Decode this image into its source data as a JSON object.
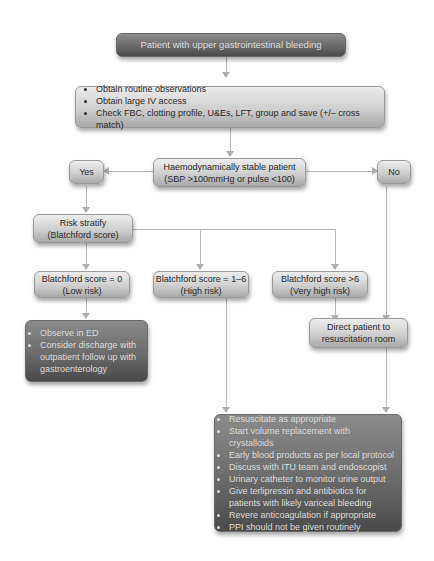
{
  "flowchart": {
    "start": "Patient with upper gastrointestinal bleeding",
    "initial_actions": [
      "Obtain routine observations",
      "Obtain large IV access",
      "Check FBC, clotting profile, U&Es, LFT, group and save (+/– cross match)"
    ],
    "decision": {
      "line1": "Haemodynamically stable patient",
      "line2": "(SBP >100mmHg or pulse <100)"
    },
    "yes_label": "Yes",
    "no_label": "No",
    "risk_stratify": {
      "line1": "Risk stratify",
      "line2": "(Blatchford score)"
    },
    "scores": [
      {
        "line1": "Blatchford score = 0",
        "line2": "(Low risk)"
      },
      {
        "line1": "Blatchford score = 1–6",
        "line2": "(High risk)"
      },
      {
        "line1": "Blatchford score >6",
        "line2": "(Very high risk)"
      }
    ],
    "low_risk_actions": [
      "Observe in ED",
      "Consider discharge with outpatient follow up with gastroenterology"
    ],
    "resus": {
      "line1": "Direct patient to",
      "line2": "resuscitation room"
    },
    "high_risk_actions": [
      "Resuscitate as appropriate",
      "Start volume replacement with crystalloids",
      "Early blood products as per local protocol",
      "Discuss with ITU team and endoscopist",
      "Urinary catheter to monitor urine output",
      "Give terlipressin and antibiotics for patients with likely variceal bleeding",
      "Revere anticoagulation if appropriate",
      "PPI should not be given routinely"
    ]
  },
  "colors": {
    "dark_box": "#6e6e6e",
    "light_box": "#d0d0d0",
    "connector": "#b8b8b8"
  }
}
